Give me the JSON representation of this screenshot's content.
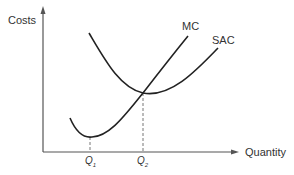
{
  "diagram": {
    "y_axis_label": "Costs",
    "x_axis_label": "Quantity",
    "curves": [
      {
        "name": "MC",
        "label": "MC"
      },
      {
        "name": "SAC",
        "label": "SAC"
      }
    ],
    "ticks": [
      {
        "label": "Q",
        "subscript": "1"
      },
      {
        "label": "Q",
        "subscript": "2"
      }
    ],
    "colors": {
      "line": "#222222",
      "axis": "#555555",
      "text": "#333333"
    }
  }
}
